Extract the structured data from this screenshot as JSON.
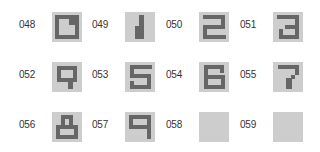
{
  "colors": {
    "tile_bg": "#cdcdcd",
    "glyph": "#666666",
    "label": "#333333"
  },
  "tiles": [
    {
      "label": "048",
      "glyph": "0",
      "rects": [
        [
          3,
          3,
          24,
          4
        ],
        [
          3,
          3,
          4,
          24
        ],
        [
          3,
          23,
          24,
          4
        ],
        [
          23,
          3,
          4,
          24
        ],
        [
          17,
          7,
          6,
          6
        ]
      ]
    },
    {
      "label": "049",
      "glyph": "1",
      "rects": [
        [
          14,
          3,
          5,
          24
        ],
        [
          10,
          14,
          4,
          13
        ]
      ]
    },
    {
      "label": "050",
      "glyph": "2",
      "rects": [
        [
          4,
          3,
          22,
          4
        ],
        [
          22,
          3,
          4,
          13
        ],
        [
          4,
          13,
          22,
          4
        ],
        [
          4,
          13,
          4,
          14
        ],
        [
          4,
          23,
          23,
          4
        ]
      ]
    },
    {
      "label": "051",
      "glyph": "3",
      "rects": [
        [
          4,
          3,
          22,
          4
        ],
        [
          22,
          3,
          4,
          24
        ],
        [
          12,
          13,
          14,
          4
        ],
        [
          6,
          23,
          20,
          4
        ],
        [
          6,
          17,
          4,
          10
        ]
      ]
    },
    {
      "label": "052",
      "glyph": "4",
      "rects": [
        [
          5,
          4,
          20,
          4
        ],
        [
          5,
          4,
          4,
          16
        ],
        [
          5,
          16,
          20,
          4
        ],
        [
          21,
          4,
          4,
          16
        ],
        [
          16,
          16,
          5,
          11
        ]
      ]
    },
    {
      "label": "053",
      "glyph": "5",
      "rects": [
        [
          5,
          3,
          22,
          4
        ],
        [
          5,
          3,
          4,
          13
        ],
        [
          5,
          12,
          21,
          4
        ],
        [
          22,
          12,
          4,
          15
        ],
        [
          5,
          23,
          21,
          4
        ],
        [
          5,
          19,
          4,
          8
        ]
      ]
    },
    {
      "label": "054",
      "glyph": "6",
      "rects": [
        [
          5,
          3,
          20,
          4
        ],
        [
          5,
          3,
          4,
          24
        ],
        [
          5,
          13,
          21,
          4
        ],
        [
          22,
          13,
          4,
          14
        ],
        [
          5,
          23,
          21,
          4
        ],
        [
          21,
          3,
          4,
          8
        ]
      ]
    },
    {
      "label": "055",
      "glyph": "7",
      "rects": [
        [
          5,
          3,
          21,
          4
        ],
        [
          22,
          3,
          4,
          10
        ],
        [
          18,
          13,
          4,
          4
        ],
        [
          13,
          16,
          6,
          11
        ]
      ]
    },
    {
      "label": "056",
      "glyph": "8",
      "rects": [
        [
          9,
          3,
          12,
          4
        ],
        [
          9,
          3,
          4,
          12
        ],
        [
          17,
          3,
          4,
          12
        ],
        [
          4,
          13,
          22,
          4
        ],
        [
          4,
          13,
          4,
          14
        ],
        [
          22,
          13,
          4,
          14
        ],
        [
          4,
          23,
          22,
          4
        ]
      ]
    },
    {
      "label": "057",
      "glyph": "9",
      "rects": [
        [
          4,
          3,
          22,
          4
        ],
        [
          4,
          3,
          4,
          14
        ],
        [
          4,
          13,
          22,
          4
        ],
        [
          22,
          3,
          4,
          24
        ]
      ]
    },
    {
      "label": "058",
      "glyph": "",
      "rects": []
    },
    {
      "label": "059",
      "glyph": "",
      "rects": []
    }
  ]
}
